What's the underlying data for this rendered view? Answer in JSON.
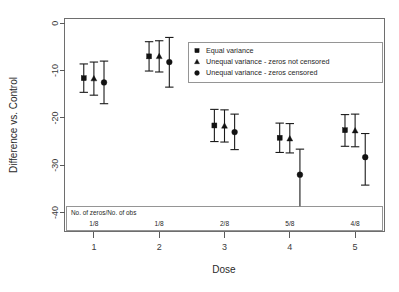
{
  "chart_data": {
    "type": "scatter",
    "title": "",
    "xlabel": "Dose",
    "ylabel": "Difference vs. Control",
    "x": [
      1,
      2,
      3,
      4,
      5
    ],
    "categories": [
      "1",
      "2",
      "3",
      "4",
      "5"
    ],
    "xtick_labels": [
      "1",
      "2",
      "3",
      "4",
      "5"
    ],
    "ytick_labels": [
      "0",
      "-10",
      "-20",
      "-30",
      "-40"
    ],
    "ytick_values": [
      0,
      -10,
      -20,
      -30,
      -40
    ],
    "ylim": [
      -44,
      1
    ],
    "xlim": [
      0.55,
      5.45
    ],
    "grid": false,
    "legend_position": "upper right",
    "series": [
      {
        "name": "Equal variance",
        "marker": "square",
        "color": "#121212",
        "values": [
          -11.6,
          -7.0,
          -21.6,
          -24.2,
          -22.6
        ],
        "err_low": [
          -14.6,
          -10.1,
          -25.0,
          -27.3,
          -26.0
        ],
        "err_high": [
          -8.6,
          -3.9,
          -18.2,
          -21.1,
          -19.3
        ]
      },
      {
        "name": "Unequal variance - zeros not censored",
        "marker": "triangle",
        "color": "#121212",
        "values": [
          -11.7,
          -7.0,
          -21.7,
          -24.4,
          -22.7
        ],
        "err_low": [
          -15.2,
          -10.3,
          -25.1,
          -27.4,
          -26.1
        ],
        "err_high": [
          -8.2,
          -3.7,
          -18.3,
          -21.2,
          -19.2
        ]
      },
      {
        "name": "Unequal variance - zeros censored",
        "marker": "circle",
        "color": "#121212",
        "values": [
          -12.5,
          -8.2,
          -23.0,
          -32.0,
          -28.3
        ],
        "err_low": [
          -17.0,
          -13.5,
          -26.7,
          -39.6,
          -34.2
        ],
        "err_high": [
          -8.0,
          -3.0,
          -19.2,
          -26.6,
          -23.3
        ]
      }
    ],
    "annotation": {
      "header": "No. of zeros/No. of obs",
      "values": [
        "1/8",
        "1/8",
        "2/8",
        "5/8",
        "4/8"
      ]
    }
  },
  "legend": {
    "entries": [
      {
        "label": "Equal variance",
        "marker": "square"
      },
      {
        "label": "Unequal variance - zeros not censored",
        "marker": "triangle"
      },
      {
        "label": "Unequal variance - zeros censored",
        "marker": "circle"
      }
    ]
  },
  "colors": {
    "marker": "#121212",
    "axis": "#5a5a5a",
    "frame": "#6e6e6e",
    "background": "#ffffff"
  }
}
